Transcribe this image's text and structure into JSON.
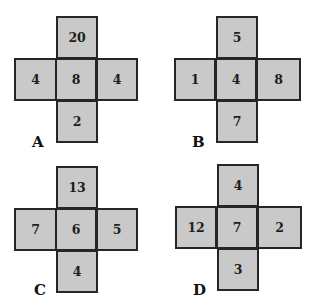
{
  "puzzles": [
    {
      "label": "A",
      "top": "20",
      "left": "4",
      "center": "8",
      "right": "4",
      "bottom": "2"
    },
    {
      "label": "B",
      "top": "5",
      "left": "1",
      "center": "4",
      "right": "8",
      "bottom": "7"
    },
    {
      "label": "C",
      "top": "13",
      "left": "7",
      "center": "6",
      "right": "5",
      "bottom": "4"
    },
    {
      "label": "D",
      "top": "4",
      "left": "12",
      "center": "7",
      "right": "2",
      "bottom": "3"
    }
  ],
  "colors": {
    "cell_fill": "#c9c9c9",
    "cell_border": "#262626",
    "text": "#1e1e1e",
    "background": "#ffffff"
  }
}
